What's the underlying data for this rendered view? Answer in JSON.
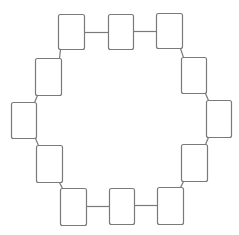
{
  "diagram": {
    "type": "ring-of-nodes",
    "width": 239,
    "height": 235,
    "stroke_color": "#7a7a7a",
    "fill_color": "#ffffff",
    "node_radius": 2,
    "nodes": [
      {
        "id": "n1",
        "x": 58,
        "y": 14,
        "w": 26,
        "h": 35
      },
      {
        "id": "n2",
        "x": 108,
        "y": 14,
        "w": 25,
        "h": 35
      },
      {
        "id": "n3",
        "x": 156,
        "y": 13,
        "w": 26,
        "h": 35
      },
      {
        "id": "n4",
        "x": 181,
        "y": 57,
        "w": 25,
        "h": 36
      },
      {
        "id": "n5",
        "x": 206,
        "y": 100,
        "w": 25,
        "h": 37
      },
      {
        "id": "n6",
        "x": 181,
        "y": 144,
        "w": 26,
        "h": 37
      },
      {
        "id": "n7",
        "x": 157,
        "y": 187,
        "w": 26,
        "h": 37
      },
      {
        "id": "n8",
        "x": 109,
        "y": 188,
        "w": 25,
        "h": 36
      },
      {
        "id": "n9",
        "x": 60,
        "y": 188,
        "w": 26,
        "h": 37
      },
      {
        "id": "n10",
        "x": 36,
        "y": 145,
        "w": 26,
        "h": 37
      },
      {
        "id": "n11",
        "x": 11,
        "y": 102,
        "w": 25,
        "h": 36
      },
      {
        "id": "n12",
        "x": 35,
        "y": 58,
        "w": 26,
        "h": 37
      }
    ],
    "edges": [
      {
        "from": "n1",
        "to": "n2",
        "x1": 84,
        "y1": 32,
        "x2": 108,
        "y2": 32
      },
      {
        "from": "n2",
        "to": "n3",
        "x1": 133,
        "y1": 31,
        "x2": 156,
        "y2": 31
      },
      {
        "from": "n3",
        "to": "n4",
        "x1": 180,
        "y1": 48,
        "x2": 183,
        "y2": 57
      },
      {
        "from": "n4",
        "to": "n5",
        "x1": 205,
        "y1": 93,
        "x2": 208,
        "y2": 100
      },
      {
        "from": "n5",
        "to": "n6",
        "x1": 208,
        "y1": 137,
        "x2": 205,
        "y2": 144
      },
      {
        "from": "n6",
        "to": "n7",
        "x1": 183,
        "y1": 181,
        "x2": 180,
        "y2": 187
      },
      {
        "from": "n7",
        "to": "n8",
        "x1": 157,
        "y1": 205,
        "x2": 134,
        "y2": 205
      },
      {
        "from": "n8",
        "to": "n9",
        "x1": 109,
        "y1": 206,
        "x2": 86,
        "y2": 206
      },
      {
        "from": "n9",
        "to": "n10",
        "x1": 62,
        "y1": 188,
        "x2": 59,
        "y2": 182
      },
      {
        "from": "n10",
        "to": "n11",
        "x1": 38,
        "y1": 145,
        "x2": 35,
        "y2": 138
      },
      {
        "from": "n11",
        "to": "n12",
        "x1": 34,
        "y1": 102,
        "x2": 37,
        "y2": 95
      },
      {
        "from": "n12",
        "to": "n1",
        "x1": 59,
        "y1": 58,
        "x2": 60,
        "y2": 49
      }
    ]
  }
}
